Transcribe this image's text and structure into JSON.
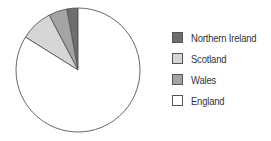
{
  "chart_data": {
    "type": "pie",
    "title": "",
    "start": "top",
    "direction": "counterclockwise",
    "slices": [
      {
        "label": "Northern Ireland",
        "value": 2.9,
        "color": "#6e6e6e"
      },
      {
        "label": "Wales",
        "value": 4.8,
        "color": "#a4a4a4"
      },
      {
        "label": "Scotland",
        "value": 8.4,
        "color": "#d6d6d6"
      },
      {
        "label": "England",
        "value": 83.9,
        "color": "#ffffff"
      }
    ],
    "legend": {
      "position": "right",
      "entries": [
        {
          "label": "Northern Ireland",
          "color": "#6e6e6e"
        },
        {
          "label": "Scotland",
          "color": "#d6d6d6"
        },
        {
          "label": "Wales",
          "color": "#a4a4a4"
        },
        {
          "label": "England",
          "color": "#ffffff"
        }
      ]
    }
  }
}
